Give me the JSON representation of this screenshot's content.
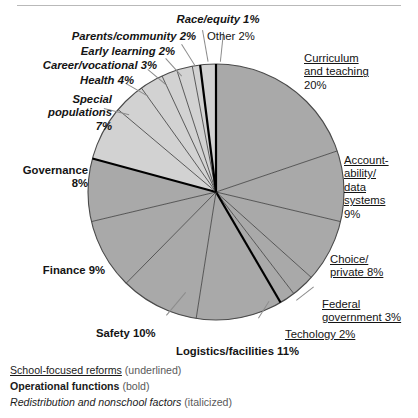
{
  "header": {
    "title_remnant": "",
    "rule": true
  },
  "chart_data": {
    "type": "pie",
    "title": "",
    "start_angle_deg": 0,
    "direction": "clockwise",
    "total": 100,
    "unit": "%",
    "categories": [
      "Curriculum and teaching",
      "Accountability/data systems",
      "Choice/private",
      "Federal government",
      "Techology",
      "Logistics/facilities",
      "Safety",
      "Finance",
      "Governance",
      "Special populations",
      "Health",
      "Career/vocational",
      "Early learning",
      "Parents/community",
      "Race/equity",
      "Other"
    ],
    "values": [
      20,
      9,
      8,
      3,
      2,
      11,
      10,
      9,
      8,
      7,
      4,
      3,
      2,
      2,
      1,
      2
    ],
    "slice_styles": [
      "underlined",
      "underlined",
      "underlined",
      "underlined",
      "underlined",
      "bold",
      "bold",
      "bold",
      "bold",
      "italic",
      "italic",
      "italic",
      "italic",
      "italic",
      "italic",
      "plain"
    ],
    "slice_colors": [
      "#a9a9a9",
      "#a9a9a9",
      "#a9a9a9",
      "#a9a9a9",
      "#a9a9a9",
      "#a9a9a9",
      "#a9a9a9",
      "#a9a9a9",
      "#a9a9a9",
      "#d2d2d2",
      "#d2d2d2",
      "#d2d2d2",
      "#d2d2d2",
      "#d2d2d2",
      "#d2d2d2",
      "#d2d2d2"
    ],
    "legend_position": "bottom-left",
    "grid": false
  },
  "slices": {
    "curriculum": {
      "name": "Curriculum and teaching",
      "line1": "Curriculum",
      "line2": "and teaching",
      "pct": "20%",
      "value": 20
    },
    "accountability": {
      "name": "Accountability/data systems",
      "line1": "Account-",
      "line2": "ability/",
      "line3": "data",
      "line4": "systems",
      "pct": "9%",
      "value": 9
    },
    "choice": {
      "name": "Choice/private",
      "line1": "Choice/",
      "line2": "private 8%",
      "pct": "8%",
      "value": 8
    },
    "federal": {
      "name": "Federal government",
      "line1": "Federal",
      "line2": "government 3%",
      "pct": "3%",
      "value": 3
    },
    "technology": {
      "name": "Techology",
      "text": "Techology 2%",
      "pct": "2%",
      "value": 2
    },
    "logistics": {
      "name": "Logistics/facilities",
      "text": "Logistics/facilities 11%",
      "pct": "11%",
      "value": 11
    },
    "safety": {
      "name": "Safety",
      "text": "Safety 10%",
      "pct": "10%",
      "value": 10
    },
    "finance": {
      "name": "Finance",
      "text": "Finance 9%",
      "pct": "9%",
      "value": 9
    },
    "governance": {
      "name": "Governance",
      "line1": "Governance",
      "line2": "8%",
      "pct": "8%",
      "value": 8
    },
    "special": {
      "name": "Special populations",
      "line1": "Special",
      "line2": "populations",
      "line3": "7%",
      "pct": "7%",
      "value": 7
    },
    "health": {
      "name": "Health",
      "text": "Health 4%",
      "pct": "4%",
      "value": 4
    },
    "career": {
      "name": "Career/vocational",
      "text": "Career/vocational 3%",
      "pct": "3%",
      "value": 3
    },
    "early": {
      "name": "Early learning",
      "text": "Early learning 2%",
      "pct": "2%",
      "value": 2
    },
    "parents": {
      "name": "Parents/community",
      "text": "Parents/community 2%",
      "pct": "2%",
      "value": 2
    },
    "race": {
      "name": "Race/equity",
      "text": "Race/equity 1%",
      "pct": "1%",
      "value": 1
    },
    "other": {
      "name": "Other",
      "text": "Other 2%",
      "pct": "2%",
      "value": 2
    }
  },
  "legend": {
    "rows": [
      {
        "key": "School-focused reforms",
        "note": "(underlined)"
      },
      {
        "key": "Operational functions",
        "note": "(bold)"
      },
      {
        "key": "Redistribution and nonschool factors",
        "note": "(italicized)"
      }
    ]
  },
  "colors": {
    "slice_dark": "#a9a9a9",
    "slice_light": "#d2d2d2",
    "slice_stroke": "#4a4a4a",
    "slice_stroke_heavy": "#000000",
    "background": "#ffffff",
    "rule": "#b9b9b9",
    "leader": "#8c8c8c",
    "text": "#141414"
  }
}
